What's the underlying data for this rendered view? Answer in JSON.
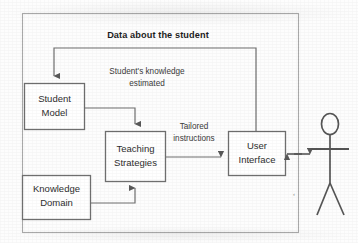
{
  "diagram": {
    "type": "block-diagram",
    "top_label": "Data about the student",
    "boxes": [
      {
        "id": "student-model",
        "line1": "Student",
        "line2": "Model",
        "x": 24,
        "y": 83,
        "w": 60,
        "h": 46
      },
      {
        "id": "knowledge-domain",
        "line1": "Knowledge",
        "line2": "Domain",
        "x": 22,
        "y": 175,
        "w": 68,
        "h": 44
      },
      {
        "id": "teaching-strategies",
        "line1": "Teaching",
        "line2": "Strategies",
        "x": 105,
        "y": 131,
        "w": 60,
        "h": 50
      },
      {
        "id": "user-interface",
        "line1": "User",
        "line2": "Interface",
        "x": 228,
        "y": 131,
        "w": 57,
        "h": 44
      }
    ],
    "edge_labels": [
      {
        "id": "student-knowledge-estimated",
        "line1": "Student's knowledge",
        "line2": "estimated"
      },
      {
        "id": "tailored-instructions",
        "line1": "Tailored",
        "line2": "instructions"
      }
    ],
    "actor": {
      "id": "student-actor",
      "label": ""
    },
    "colors": {
      "stroke": "#6f6f6f",
      "box_fill": "#ffffff",
      "text": "#2e2e2e",
      "title_text": "#1d1d1d",
      "background": "#fdfdfd",
      "outer_border": "#a8a8a8"
    }
  }
}
